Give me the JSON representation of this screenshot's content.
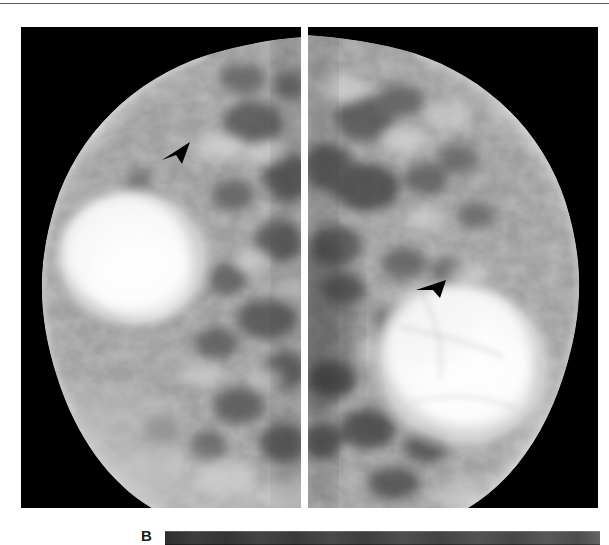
{
  "figure": {
    "panel_label": "B",
    "top_rule": true,
    "background_color": "#ffffff",
    "panels": [
      {
        "name": "left-mammogram",
        "side": "left",
        "modality": "mammogram",
        "background_color": "#000000",
        "marker": {
          "type": "arrowhead",
          "direction": "down-left",
          "color": "#000000",
          "x": 160,
          "y": 140
        }
      },
      {
        "name": "right-mammogram",
        "side": "right",
        "modality": "mammogram",
        "background_color": "#000000",
        "marker": {
          "type": "arrowhead",
          "direction": "left",
          "color": "#000000",
          "x": 415,
          "y": 278
        }
      }
    ],
    "grayscale_bar": {
      "name": "grayscale-step-wedge",
      "from_color": "#2e2e2e",
      "to_color": "#646464"
    }
  }
}
